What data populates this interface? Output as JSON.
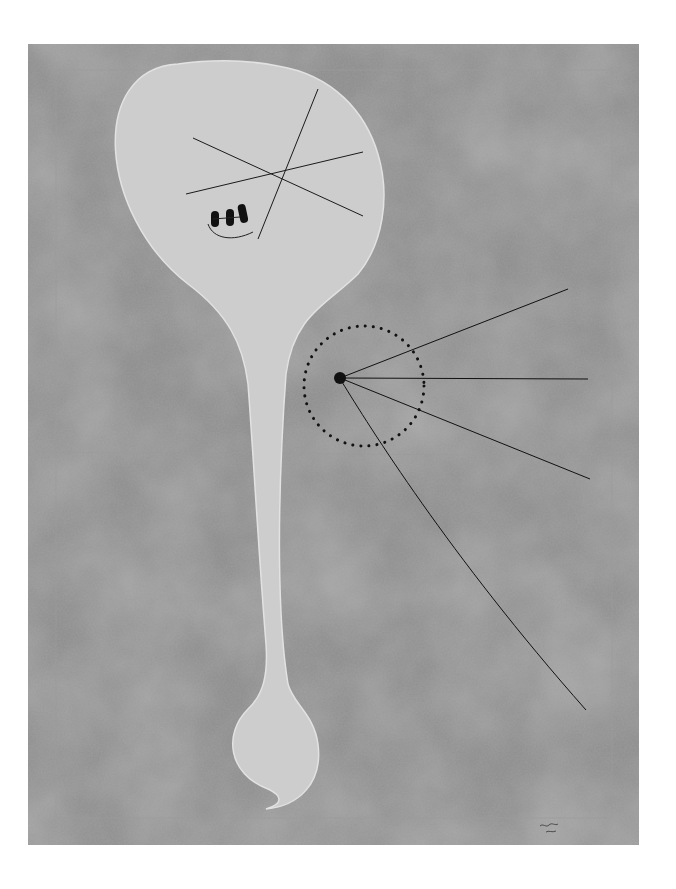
{
  "artwork": {
    "description": "Abstract painting: pale balloon-like figure with crossed lines and three black marks, a long tapering stem ending in a teardrop form, and a dotted circle with a black dot radiating lines, on a mottled gray ground.",
    "colors": {
      "background_page": "#ffffff",
      "ground": "#8f8f8f",
      "ground_dark": "#7a7a7a",
      "figure": "#cfcfcf",
      "ink": "#111111"
    }
  }
}
